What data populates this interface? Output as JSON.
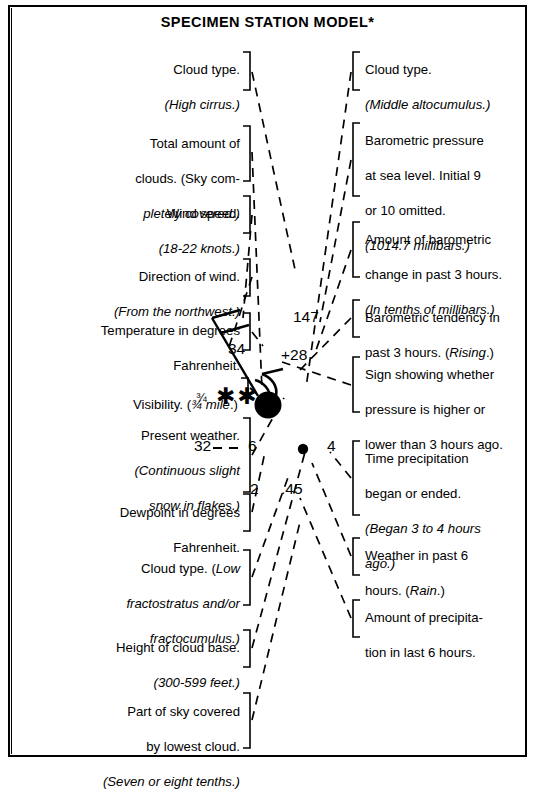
{
  "page": {
    "title": "SPECIMEN STATION MODEL*"
  },
  "labels_left": [
    {
      "id": "cloud-type-high",
      "lines": [
        {
          "text": "Cloud type.",
          "italic": false
        },
        {
          "text": "(High cirrus.)",
          "italic": true
        }
      ]
    },
    {
      "id": "total-amount-of-clouds",
      "lines": [
        {
          "text": "Total amount of",
          "italic": false
        },
        {
          "text": "clouds. (Sky com-",
          "italic": "partial"
        },
        {
          "text": "pletely covered.)",
          "italic": true
        }
      ]
    },
    {
      "id": "wind-speed",
      "lines": [
        {
          "text": "Wind speed.",
          "italic": false
        },
        {
          "text": "(18-22 knots.)",
          "italic": true
        }
      ]
    },
    {
      "id": "direction-of-wind",
      "lines": [
        {
          "text": "Direction of wind.",
          "italic": false
        },
        {
          "text": "(From the northwest.)",
          "italic": true
        }
      ]
    },
    {
      "id": "temperature",
      "lines": [
        {
          "text": "Temperature in degrees",
          "italic": false
        },
        {
          "text": "Fahrenheit.",
          "italic": false
        }
      ]
    },
    {
      "id": "visibility",
      "lines": [
        {
          "text": "Visibility. (¾ mile.)",
          "italic": "partial"
        }
      ]
    },
    {
      "id": "present-weather",
      "lines": [
        {
          "text": "Present weather.",
          "italic": false
        },
        {
          "text": "(Continuous slight",
          "italic": true
        },
        {
          "text": "snow in flakes.)",
          "italic": true
        }
      ]
    },
    {
      "id": "dewpoint",
      "lines": [
        {
          "text": "Dewpoint in degrees",
          "italic": false
        },
        {
          "text": "Fahrenheit.",
          "italic": false
        }
      ]
    },
    {
      "id": "cloud-type-low",
      "lines": [
        {
          "text": "Cloud type. (Low",
          "italic": "partial"
        },
        {
          "text": "fractostratus and/or",
          "italic": true
        },
        {
          "text": "fractocumulus.)",
          "italic": true
        }
      ]
    },
    {
      "id": "height-of-cloud-base",
      "lines": [
        {
          "text": "Height of cloud base.",
          "italic": false
        },
        {
          "text": "(300-599 feet.)",
          "italic": true
        }
      ]
    },
    {
      "id": "part-of-sky-covered",
      "lines": [
        {
          "text": "Part of sky covered",
          "italic": false
        },
        {
          "text": "by lowest cloud.",
          "italic": false
        },
        {
          "text": "(Seven or eight tenths.)",
          "italic": true
        }
      ]
    }
  ],
  "labels_right": [
    {
      "id": "cloud-type-middle",
      "lines": [
        {
          "text": "Cloud type.",
          "italic": false
        },
        {
          "text": "(Middle altocumulus.)",
          "italic": true
        }
      ]
    },
    {
      "id": "barometric-pressure",
      "lines": [
        {
          "text": "Barometric pressure",
          "italic": false
        },
        {
          "text": "at sea level. Initial 9",
          "italic": false
        },
        {
          "text": "or 10 omitted.",
          "italic": false
        },
        {
          "text": "(1014.7 millibars.)",
          "italic": true
        }
      ]
    },
    {
      "id": "amount-of-barometric-change",
      "lines": [
        {
          "text": "Amount of barometric",
          "italic": false
        },
        {
          "text": "change in past 3 hours.",
          "italic": false
        },
        {
          "text": "(In tenths of millibars.)",
          "italic": true
        }
      ]
    },
    {
      "id": "barometric-tendency",
      "lines": [
        {
          "text": "Barometric tendency in",
          "italic": false
        },
        {
          "text": "past 3 hours. (Rising.)",
          "italic": "partial"
        }
      ]
    },
    {
      "id": "sign-showing-pressure",
      "lines": [
        {
          "text": "Sign showing whether",
          "italic": false
        },
        {
          "text": "pressure is higher or",
          "italic": false
        },
        {
          "text": "lower than 3 hours ago.",
          "italic": false
        }
      ]
    },
    {
      "id": "time-precipitation",
      "lines": [
        {
          "text": "Time precipitation",
          "italic": false
        },
        {
          "text": "began or ended.",
          "italic": false
        },
        {
          "text": "(Began 3 to 4 hours",
          "italic": true
        },
        {
          "text": "ago.)",
          "italic": true
        }
      ]
    },
    {
      "id": "weather-past-6-hours",
      "lines": [
        {
          "text": "Weather in past 6",
          "italic": false
        },
        {
          "text": "hours. (Rain.)",
          "italic": "partial"
        }
      ]
    },
    {
      "id": "amount-of-precipitation",
      "lines": [
        {
          "text": "Amount of precipita-",
          "italic": false
        },
        {
          "text": "tion in last 6 hours.",
          "italic": false
        }
      ]
    }
  ],
  "station_model": {
    "temperature": "34",
    "visibility": "¾",
    "present_weather_symbol": "✱✱",
    "pressure": "147",
    "pressure_change": "+28",
    "dewpoint": "32",
    "cloud_base_height": "6",
    "past_weather_symbol": "●",
    "time_precipitation": "4",
    "sky_cover_lowest": "2",
    "precipitation_amount": ".45",
    "sky_cover_total": "filled circle (sky completely covered)",
    "wind_barb": "from the northwest, two full barbs (18-22 knots)",
    "tendency_symbol": "rising"
  },
  "colors": {
    "ink": "#000000",
    "paper": "#ffffff"
  }
}
